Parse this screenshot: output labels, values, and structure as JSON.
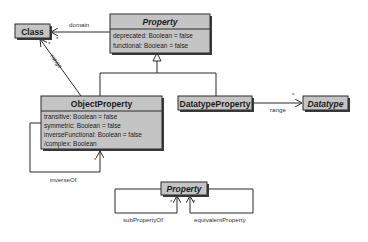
{
  "diagram": {
    "type": "uml-class-diagram",
    "classes": {
      "class": {
        "name": "Class"
      },
      "property": {
        "name": "Property",
        "abstract": true,
        "attributes": [
          "deprecated: Boolean = false",
          "functional: Boolean = false"
        ]
      },
      "object_property": {
        "name": "ObjectProperty",
        "attributes": [
          "transitive: Boolean = false",
          "symmetric: Boolean = false",
          "inverseFunctional: Boolean = false",
          "/complex: Boolean"
        ]
      },
      "datatype_property": {
        "name": "DatatypeProperty"
      },
      "datatype": {
        "name": "Datatype",
        "abstract": true
      },
      "property_bottom": {
        "name": "Property",
        "abstract": true
      }
    },
    "associations": {
      "domain": {
        "label": "domain",
        "multiplicity": "*"
      },
      "object_range": {
        "label": "range",
        "multiplicity": "*"
      },
      "datatype_range": {
        "label": "range",
        "multiplicity": "*"
      },
      "inverse_of": {
        "label": "inverseOf",
        "multiplicity": "*"
      },
      "sub_property_of": {
        "label": "subPropertyOf",
        "multiplicity": "*"
      },
      "equivalent_property": {
        "label": "equivalentProperty",
        "multiplicity": "*"
      }
    },
    "colors": {
      "box_fill": "#c4c4c4",
      "stroke": "#2a2a2a",
      "background": "#ffffff"
    }
  }
}
